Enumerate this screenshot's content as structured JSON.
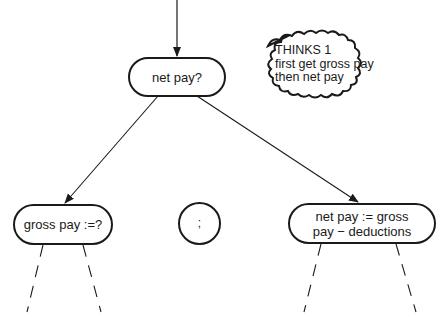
{
  "diagram": {
    "type": "program-design-tree",
    "root": {
      "label": "net pay?"
    },
    "children": [
      {
        "label": "gross pay :=?",
        "shape": "rounded-rect"
      },
      {
        "label": ";",
        "shape": "circle"
      },
      {
        "label_line1": "net pay := gross",
        "label_line2": "pay − deductions",
        "shape": "rounded-rect"
      }
    ],
    "thought": {
      "title": "THINKS 1",
      "line1": "first get gross pay",
      "line2": "then net pay"
    }
  }
}
